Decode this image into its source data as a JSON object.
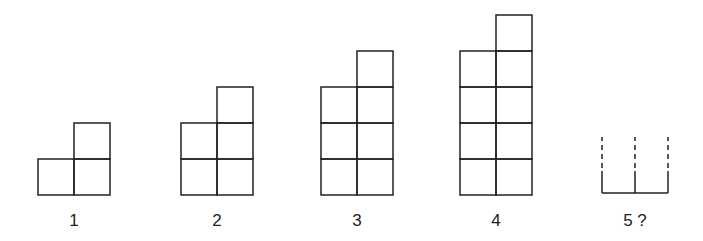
{
  "style": {
    "stroke": "#222222",
    "background": "#ffffff"
  },
  "cell_size": 36,
  "figures": [
    {
      "label": "1",
      "left_column_cells": 1,
      "right_column_cells": 2,
      "x": 38,
      "base_y": 195
    },
    {
      "label": "2",
      "left_column_cells": 2,
      "right_column_cells": 3,
      "x": 181,
      "base_y": 195
    },
    {
      "label": "3",
      "left_column_cells": 3,
      "right_column_cells": 4,
      "x": 321,
      "base_y": 195
    },
    {
      "label": "4",
      "left_column_cells": 4,
      "right_column_cells": 5,
      "x": 460,
      "base_y": 195
    }
  ],
  "unknown_figure": {
    "label": "5 ?",
    "x": 602,
    "base_y": 193,
    "width": 66,
    "solid_height": 22,
    "dashed_top_y": 137
  },
  "label_y": 211
}
